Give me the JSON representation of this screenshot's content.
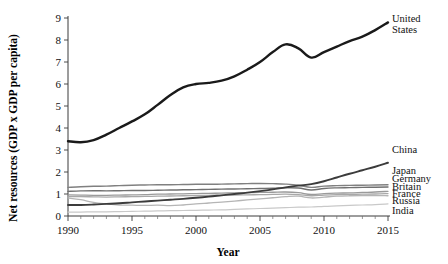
{
  "chart_data": {
    "type": "line",
    "title": "",
    "xlabel": "Year",
    "ylabel": "Net resources (GDP x GDP per capita)",
    "xlim": [
      1990,
      2015
    ],
    "ylim": [
      0,
      9
    ],
    "xticks": [
      1990,
      1995,
      2000,
      2005,
      2010,
      2015
    ],
    "yticks": [
      0,
      1,
      2,
      3,
      4,
      5,
      6,
      7,
      8,
      9
    ],
    "grid": false,
    "legend_position": "right-inline-labels",
    "x": [
      1990,
      1991,
      1992,
      1993,
      1994,
      1995,
      1996,
      1997,
      1998,
      1999,
      2000,
      2001,
      2002,
      2003,
      2004,
      2005,
      2006,
      2007,
      2008,
      2009,
      2010,
      2011,
      2012,
      2013,
      2014,
      2015
    ],
    "series": [
      {
        "name": "United States",
        "label": "United States",
        "color": "#1a1a1a",
        "width": 2.4,
        "values": [
          3.4,
          3.35,
          3.45,
          3.7,
          4.0,
          4.3,
          4.62,
          5.05,
          5.5,
          5.85,
          6.0,
          6.05,
          6.15,
          6.35,
          6.65,
          7.0,
          7.45,
          7.8,
          7.62,
          7.2,
          7.45,
          7.7,
          7.95,
          8.15,
          8.45,
          8.8
        ]
      },
      {
        "name": "China",
        "label": "China",
        "color": "#3c3c3c",
        "width": 1.9,
        "values": [
          0.5,
          0.5,
          0.52,
          0.55,
          0.58,
          0.62,
          0.66,
          0.7,
          0.74,
          0.78,
          0.83,
          0.88,
          0.94,
          1.0,
          1.06,
          1.13,
          1.21,
          1.3,
          1.38,
          1.45,
          1.58,
          1.75,
          1.92,
          2.08,
          2.24,
          2.42
        ]
      },
      {
        "name": "Japan",
        "label": "Japan",
        "color": "#808080",
        "width": 1.4,
        "values": [
          1.3,
          1.33,
          1.35,
          1.36,
          1.38,
          1.4,
          1.41,
          1.42,
          1.42,
          1.43,
          1.44,
          1.44,
          1.45,
          1.46,
          1.47,
          1.48,
          1.47,
          1.45,
          1.4,
          1.3,
          1.36,
          1.38,
          1.39,
          1.4,
          1.41,
          1.42
        ]
      },
      {
        "name": "Germany",
        "label": "Germany",
        "color": "#707070",
        "width": 1.4,
        "values": [
          1.12,
          1.14,
          1.15,
          1.14,
          1.15,
          1.16,
          1.16,
          1.17,
          1.18,
          1.19,
          1.2,
          1.21,
          1.22,
          1.23,
          1.24,
          1.25,
          1.26,
          1.28,
          1.27,
          1.18,
          1.25,
          1.28,
          1.29,
          1.3,
          1.31,
          1.32
        ]
      },
      {
        "name": "Britain",
        "label": "Britain",
        "color": "#9a9a9a",
        "width": 1.3,
        "values": [
          0.96,
          0.95,
          0.94,
          0.94,
          0.95,
          0.96,
          0.97,
          0.99,
          1.0,
          1.01,
          1.02,
          1.03,
          1.04,
          1.05,
          1.06,
          1.07,
          1.08,
          1.09,
          1.06,
          0.98,
          1.02,
          1.04,
          1.05,
          1.07,
          1.09,
          1.12
        ]
      },
      {
        "name": "France",
        "label": "France",
        "color": "#a8a8a8",
        "width": 1.3,
        "values": [
          0.88,
          0.88,
          0.87,
          0.86,
          0.87,
          0.88,
          0.89,
          0.9,
          0.91,
          0.92,
          0.93,
          0.94,
          0.95,
          0.95,
          0.96,
          0.97,
          0.98,
          0.99,
          0.97,
          0.92,
          0.95,
          0.97,
          0.98,
          0.99,
          1.0,
          1.02
        ]
      },
      {
        "name": "Russia",
        "label": "Russia",
        "color": "#b5b5b5",
        "width": 1.3,
        "values": [
          0.82,
          0.74,
          0.62,
          0.55,
          0.5,
          0.49,
          0.48,
          0.49,
          0.47,
          0.5,
          0.55,
          0.59,
          0.63,
          0.68,
          0.73,
          0.78,
          0.83,
          0.88,
          0.9,
          0.82,
          0.86,
          0.9,
          0.92,
          0.93,
          0.93,
          0.92
        ]
      },
      {
        "name": "India",
        "label": "India",
        "color": "#c9c9c9",
        "width": 1.2,
        "values": [
          0.18,
          0.18,
          0.19,
          0.19,
          0.2,
          0.21,
          0.22,
          0.23,
          0.24,
          0.25,
          0.26,
          0.27,
          0.28,
          0.3,
          0.32,
          0.34,
          0.36,
          0.38,
          0.4,
          0.41,
          0.44,
          0.46,
          0.48,
          0.5,
          0.52,
          0.55
        ]
      }
    ],
    "series_labels_right": [
      {
        "text": "United States",
        "lines": [
          "United",
          "States"
        ],
        "anchor_value": 8.8
      },
      {
        "text": "China",
        "lines": [
          "China"
        ],
        "anchor_value": 2.42
      },
      {
        "text": "Japan",
        "lines": [
          "Japan"
        ],
        "anchor_value": 1.42
      },
      {
        "text": "Germany",
        "lines": [
          "Germany"
        ],
        "anchor_value": 1.32
      },
      {
        "text": "Britain",
        "lines": [
          "Britain"
        ],
        "anchor_value": 1.12
      },
      {
        "text": "France",
        "lines": [
          "France"
        ],
        "anchor_value": 1.02
      },
      {
        "text": "Russia",
        "lines": [
          "Russia"
        ],
        "anchor_value": 0.92
      },
      {
        "text": "India",
        "lines": [
          "India"
        ],
        "anchor_value": 0.55
      }
    ]
  }
}
